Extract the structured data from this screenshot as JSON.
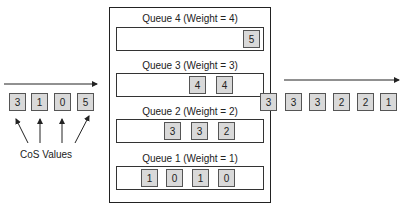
{
  "input": {
    "cells": [
      "3",
      "1",
      "0",
      "5"
    ],
    "annotation": "CoS Values"
  },
  "queues": [
    {
      "label": "Queue 4 (Weight = 4)",
      "cells": [
        "5"
      ]
    },
    {
      "label": "Queue 3 (Weight = 3)",
      "cells": [
        "4",
        "4"
      ]
    },
    {
      "label": "Queue 2 (Weight = 2)",
      "cells": [
        "3",
        "3",
        "2"
      ]
    },
    {
      "label": "Queue 1 (Weight = 1)",
      "cells": [
        "1",
        "0",
        "1",
        "0"
      ]
    }
  ],
  "output": {
    "cells": [
      "3",
      "3",
      "3",
      "2",
      "2",
      "1"
    ]
  }
}
